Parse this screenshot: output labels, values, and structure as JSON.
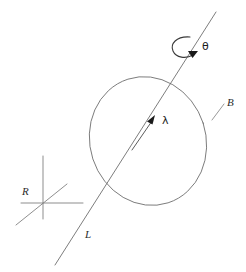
{
  "figure": {
    "background_color": "#ffffff",
    "stroke_color": "#6b6b6b",
    "label_color": "#2b2b2b",
    "width": 246,
    "height": 272
  },
  "labels": {
    "body": "B",
    "axis_line": "L",
    "spin_vector": "λ",
    "rotation_angle": "θ",
    "reference_frame": "R"
  },
  "icon_names": {
    "rotation_arrow": "curved-rotation-arrow-icon",
    "spin_vector_arrow": "vector-arrow-icon",
    "frame_axes": "coordinate-axes-icon",
    "body_outline": "circle-body-icon",
    "leader": "leader-line-icon"
  },
  "geometry": {
    "circle": {
      "cx": 148,
      "cy": 141,
      "rx": 58,
      "ry": 65,
      "rotation_deg": -18
    },
    "axis_line": {
      "x1": 55,
      "y1": 265,
      "x2": 216,
      "y2": 12
    },
    "spin_vector": {
      "x1": 131,
      "y1": 148,
      "x2": 153,
      "y2": 117
    },
    "rotation_arrow_center": {
      "cx": 186,
      "cy": 48
    },
    "frame_origin": {
      "x": 43,
      "y": 203
    },
    "body_label_pos": {
      "x": 227,
      "y": 106
    },
    "axis_label_pos": {
      "x": 85,
      "y": 238
    },
    "spin_label_pos": {
      "x": 162,
      "y": 124
    },
    "angle_label_pos": {
      "x": 202,
      "y": 50
    },
    "frame_label_pos": {
      "x": 22,
      "y": 195
    }
  }
}
